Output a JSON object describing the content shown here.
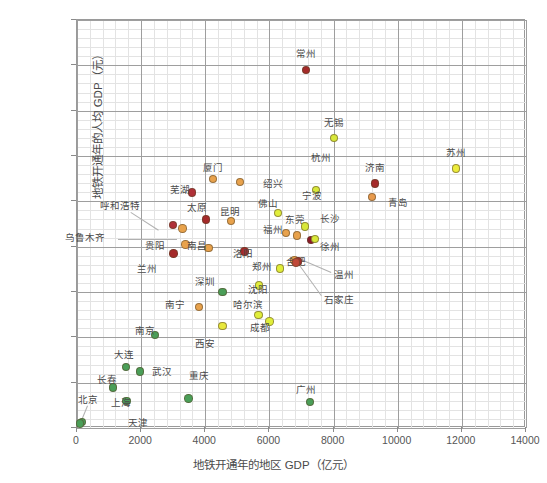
{
  "chart_data": {
    "type": "scatter",
    "title": "",
    "xlabel": "地铁开通年的地区 GDP（亿元）",
    "ylabel": "地铁开通年的人均 GDP（元）",
    "xlim": [
      0,
      14000
    ],
    "ylim": [
      0,
      180000
    ],
    "xticks": [
      0,
      2000,
      4000,
      6000,
      8000,
      10000,
      12000,
      14000
    ],
    "yticks": [
      0,
      20000,
      40000,
      60000,
      80000,
      100000,
      120000,
      140000,
      160000,
      180000
    ],
    "grid": true,
    "legend": "none",
    "minor_grid_divisions": 5,
    "color_scale": {
      "dark_red": "#a02128",
      "orange": "#e08a3c",
      "yellow": "#e8e83c",
      "yellow_green": "#d2e63a",
      "green": "#4a9e58"
    },
    "points": [
      {
        "name": "常州",
        "x": 7170,
        "y": 157500,
        "color": "#a52a2a",
        "lx": 306,
        "ly": 54,
        "anchor": "center"
      },
      {
        "name": "无锡",
        "x": 8050,
        "y": 127500,
        "color": "#d8e83a",
        "lx": 334,
        "ly": 123,
        "anchor": "center"
      },
      {
        "name": "苏州",
        "x": 11850,
        "y": 114000,
        "color": "#ecec3c",
        "lx": 456,
        "ly": 153,
        "anchor": "center"
      },
      {
        "name": "济南",
        "x": 9320,
        "y": 107500,
        "color": "#a52a2a",
        "lx": 375,
        "ly": 168,
        "anchor": "center"
      },
      {
        "name": "青岛",
        "x": 9230,
        "y": 101500,
        "color": "#e89a4c",
        "lx": 388,
        "ly": 203,
        "anchor": "left"
      },
      {
        "name": "杭州",
        "x": 7480,
        "y": 104500,
        "color": "#d8e83a",
        "lx": 321,
        "ly": 158,
        "anchor": "center"
      },
      {
        "name": "厦门",
        "x": 4280,
        "y": 109500,
        "color": "#e8a24c",
        "lx": 213,
        "ly": 168,
        "anchor": "center"
      },
      {
        "name": "绍兴",
        "x": 5110,
        "y": 108000,
        "color": "#e8a24c",
        "lx": 263,
        "ly": 184,
        "anchor": "left"
      },
      {
        "name": "芜湖",
        "x": 3620,
        "y": 103500,
        "color": "#b03038",
        "lx": 180,
        "ly": 190,
        "anchor": "center"
      },
      {
        "name": "佛山",
        "x": 6300,
        "y": 94500,
        "color": "#e0ee3a",
        "lx": 268,
        "ly": 204,
        "anchor": "center"
      },
      {
        "name": "太原",
        "x": 4050,
        "y": 91500,
        "color": "#a52a2a",
        "lx": 197,
        "ly": 208,
        "anchor": "center"
      },
      {
        "name": "昆明",
        "x": 4830,
        "y": 91000,
        "color": "#e8a24c",
        "lx": 230,
        "ly": 212,
        "anchor": "center"
      },
      {
        "name": "呼和浩特",
        "x": 3020,
        "y": 89000,
        "color": "#b03038",
        "lx": 120,
        "ly": 206,
        "anchor": "center"
      },
      {
        "name": "乌鲁木齐",
        "x": 3320,
        "y": 87500,
        "color": "#e8a24c",
        "lx": 85,
        "ly": 238,
        "anchor": "center"
      },
      {
        "name": "福州",
        "x": 6540,
        "y": 85500,
        "color": "#e8a24c",
        "lx": 273,
        "ly": 230,
        "anchor": "center"
      },
      {
        "name": "东莞",
        "x": 6900,
        "y": 84500,
        "color": "#e8a24c",
        "lx": 295,
        "ly": 220,
        "anchor": "center"
      },
      {
        "name": "徐州",
        "x": 7330,
        "y": 82500,
        "color": "#8b1a2b",
        "lx": 320,
        "ly": 247,
        "anchor": "left"
      },
      {
        "name": "长沙",
        "x": 7450,
        "y": 83000,
        "color": "#d8e83a",
        "lx": 330,
        "ly": 219,
        "anchor": "center"
      },
      {
        "name": "宁波",
        "x": 7140,
        "y": 88500,
        "color": "#d8e83a",
        "lx": 312,
        "ly": 196,
        "anchor": "center"
      },
      {
        "name": "贵阳",
        "x": 3410,
        "y": 80500,
        "color": "#e8a24c",
        "lx": 155,
        "ly": 246,
        "anchor": "center"
      },
      {
        "name": "南昌",
        "x": 4130,
        "y": 79000,
        "color": "#e8a24c",
        "lx": 197,
        "ly": 246,
        "anchor": "center"
      },
      {
        "name": "兰州",
        "x": 3040,
        "y": 76500,
        "color": "#a52a2a",
        "lx": 147,
        "ly": 269,
        "anchor": "center"
      },
      {
        "name": "洛阳",
        "x": 5260,
        "y": 77500,
        "color": "#a52a2a",
        "lx": 243,
        "ly": 254,
        "anchor": "center"
      },
      {
        "name": "合肥",
        "x": 6810,
        "y": 73500,
        "color": "#e8a24c",
        "lx": 296,
        "ly": 262,
        "anchor": "center"
      },
      {
        "name": "温州",
        "x": 6930,
        "y": 73000,
        "color": "#a52a2a",
        "lx": 334,
        "ly": 275,
        "anchor": "left"
      },
      {
        "name": "石家庄",
        "x": 6860,
        "y": 72500,
        "color": "#c04838",
        "lx": 324,
        "ly": 300,
        "anchor": "left"
      },
      {
        "name": "郑州",
        "x": 6370,
        "y": 70000,
        "color": "#e0ee3a",
        "lx": 262,
        "ly": 267,
        "anchor": "center"
      },
      {
        "name": "沈阳",
        "x": 5710,
        "y": 62500,
        "color": "#e0ee3a",
        "lx": 248,
        "ly": 290,
        "anchor": "left"
      },
      {
        "name": "深圳",
        "x": 4570,
        "y": 59500,
        "color": "#4a9e58",
        "lx": 205,
        "ly": 282,
        "anchor": "center"
      },
      {
        "name": "南宁",
        "x": 3840,
        "y": 53000,
        "color": "#e8a24c",
        "lx": 175,
        "ly": 305,
        "anchor": "center"
      },
      {
        "name": "哈尔滨",
        "x": 5690,
        "y": 49500,
        "color": "#e0ee3a",
        "lx": 248,
        "ly": 305,
        "anchor": "center"
      },
      {
        "name": "成都",
        "x": 6030,
        "y": 46500,
        "color": "#e0ee3a",
        "lx": 260,
        "ly": 328,
        "anchor": "center"
      },
      {
        "name": "西安",
        "x": 4570,
        "y": 44500,
        "color": "#e8e83c",
        "lx": 205,
        "ly": 344,
        "anchor": "center"
      },
      {
        "name": "南京",
        "x": 2460,
        "y": 40500,
        "color": "#4a9e58",
        "lx": 145,
        "ly": 331,
        "anchor": "center"
      },
      {
        "name": "大连",
        "x": 1560,
        "y": 26500,
        "color": "#4a9e58",
        "lx": 124,
        "ly": 355,
        "anchor": "center"
      },
      {
        "name": "武汉",
        "x": 1990,
        "y": 24500,
        "color": "#4a9e58",
        "lx": 152,
        "ly": 372,
        "anchor": "left"
      },
      {
        "name": "长春",
        "x": 1160,
        "y": 17500,
        "color": "#4a9e58",
        "lx": 107,
        "ly": 380,
        "anchor": "center"
      },
      {
        "name": "重庆",
        "x": 3510,
        "y": 12500,
        "color": "#4a9e58",
        "lx": 199,
        "ly": 376,
        "anchor": "center"
      },
      {
        "name": "广州",
        "x": 7300,
        "y": 11000,
        "color": "#4a9e58",
        "lx": 306,
        "ly": 390,
        "anchor": "center"
      },
      {
        "name": "上海",
        "x": 1570,
        "y": 11500,
        "color": "#4a9e58",
        "lx": 111,
        "ly": 403,
        "anchor": "left"
      },
      {
        "name": "北京",
        "x": 180,
        "y": 2300,
        "color": "#4a9e58",
        "lx": 88,
        "ly": 400,
        "anchor": "center"
      },
      {
        "name": "天津",
        "x": 120,
        "y": 1500,
        "color": "#4a9e58",
        "lx": 138,
        "ly": 423,
        "anchor": "center"
      }
    ],
    "leader_lines": [
      {
        "from_label": "呼和浩特",
        "x1": 131,
        "y1": 212,
        "x2": 159,
        "y2": 230
      },
      {
        "from_label": "乌鲁木齐",
        "x1": 118,
        "y1": 239,
        "x2": 177,
        "y2": 239
      },
      {
        "from_label": "温州",
        "x1": 331,
        "y1": 273,
        "x2": 296,
        "y2": 258
      },
      {
        "from_label": "石家庄",
        "x1": 321,
        "y1": 296,
        "x2": 295,
        "y2": 260
      },
      {
        "from_label": "北京",
        "x1": 88,
        "y1": 406,
        "x2": 81,
        "y2": 423
      }
    ]
  }
}
